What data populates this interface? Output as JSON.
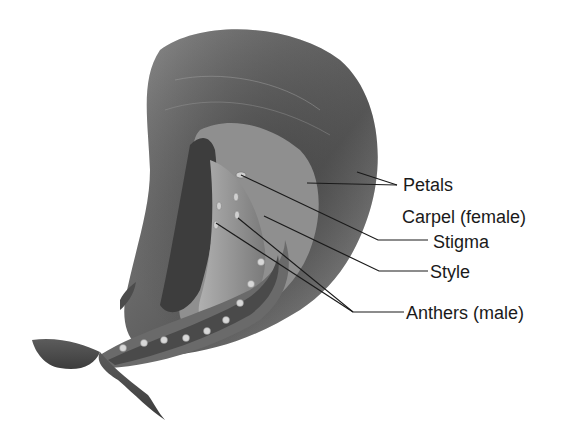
{
  "diagram": {
    "labels": [
      {
        "id": "petals",
        "text": "Petals",
        "x": 403,
        "y": 175
      },
      {
        "id": "carpel",
        "text": "Carpel (female)",
        "x": 402,
        "y": 207
      },
      {
        "id": "stigma",
        "text": "Stigma",
        "x": 433,
        "y": 234
      },
      {
        "id": "style",
        "text": "Style",
        "x": 430,
        "y": 264
      },
      {
        "id": "anthers",
        "text": "Anthers (male)",
        "x": 406,
        "y": 305
      }
    ]
  }
}
